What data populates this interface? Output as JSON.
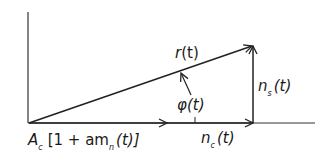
{
  "diagram": {
    "type": "phasor",
    "colors": {
      "stroke": "#222222",
      "background": "#ffffff"
    },
    "labels": {
      "resultant": {
        "base": "r",
        "arg": "(t)"
      },
      "angle": {
        "base": "φ",
        "arg": "(t)"
      },
      "quadrature_noise": {
        "base": "n",
        "sub": "s",
        "arg": "(t)"
      },
      "inphase_noise": {
        "base": "n",
        "sub": "c",
        "arg": "(t)"
      },
      "signal": {
        "A": "A",
        "A_sub": "c",
        "bracket_open": "[1 + am",
        "m_sub": "n",
        "tail": "(t)]"
      }
    }
  }
}
